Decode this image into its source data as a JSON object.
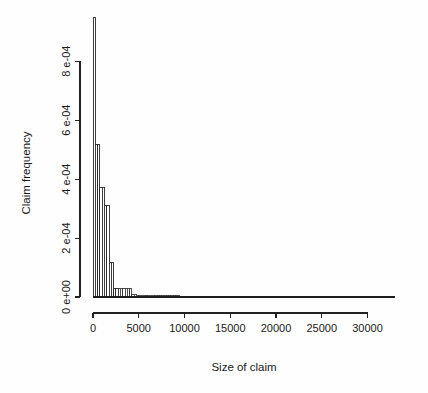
{
  "figure": {
    "background": "#fefefe",
    "foreground": "#1a1a1a"
  },
  "chart_data": {
    "type": "bar",
    "title": "",
    "subtitle": "",
    "xlabel": "Size of claim",
    "ylabel": "Claim frequency",
    "xlim": [
      0,
      33000
    ],
    "ylim": [
      0,
      0.00095
    ],
    "grid": false,
    "legend": null,
    "x_tick_values": [
      0,
      5000,
      10000,
      15000,
      20000,
      25000,
      30000
    ],
    "x_tick_labels": [
      "0",
      "5000",
      "10000",
      "15000",
      "20000",
      "25000",
      "30000"
    ],
    "y_tick_values": [
      0,
      0.0002,
      0.0004,
      0.0006,
      0.0008
    ],
    "y_tick_labels": [
      "0 e+00",
      "2 e-04",
      "4 e-04",
      "6 e-04",
      "8 e-04"
    ],
    "bin_width": 250,
    "bin_edges": [
      0,
      250,
      500,
      750,
      1000,
      1250,
      1500,
      1750,
      2000,
      2250,
      2500,
      2750,
      3000,
      3250,
      3500,
      3750,
      4000,
      4250,
      4500,
      4750,
      5000,
      5250,
      5500,
      5750,
      6000,
      6250,
      6500,
      6750,
      7000,
      7250,
      7500,
      7750,
      8000,
      8250,
      8500,
      8750,
      9000,
      9250,
      9500,
      9750,
      10000,
      10250,
      10500,
      10750,
      11000,
      11250,
      11500,
      11750,
      12000,
      12250,
      12500,
      12750,
      13000,
      13250,
      13500,
      13750,
      14000,
      14250,
      14500,
      14750,
      15000,
      15250,
      15500,
      15750,
      16000,
      16250,
      16500,
      16750,
      17000,
      17250,
      17500,
      17750,
      18000,
      18250,
      18500,
      18750,
      19000,
      19250,
      19500,
      19750,
      20000,
      20250,
      20500,
      20750,
      21000,
      21250,
      21500,
      21750,
      22000,
      22250,
      22500,
      22750,
      23000,
      23250,
      23500,
      23750,
      24000,
      24250,
      24500,
      24750,
      25000,
      25250,
      25500,
      25750,
      26000,
      26250,
      26500,
      26750,
      27000,
      27250,
      27500,
      27750,
      28000,
      28250,
      28500,
      28750,
      29000,
      29250,
      29500,
      29750,
      30000,
      30250,
      30500,
      30750,
      31000,
      31250,
      31500,
      31750,
      32000,
      32250,
      32500
    ],
    "values": [
      0.000948,
      0.000517,
      0.000516,
      0.000372,
      0.000371,
      0.000312,
      0.000311,
      0.000118,
      0.000117,
      2.95e-05,
      2.94e-05,
      2.92e-05,
      2.9e-05,
      2.88e-05,
      2.86e-05,
      2.84e-05,
      2.82e-05,
      8.8e-06,
      8.6e-06,
      6.6e-06,
      6.4e-06,
      6.2e-06,
      6e-06,
      5.8e-06,
      5.6e-06,
      5.4e-06,
      5.2e-06,
      5e-06,
      4.8e-06,
      4.6e-06,
      4.4e-06,
      4.2e-06,
      4e-06,
      3.9e-06,
      3.8e-06,
      3.7e-06,
      3.6e-06,
      3.5e-06,
      3.4e-06,
      3.3e-06,
      3.2e-06,
      3.1e-06,
      3e-06,
      2.9e-06,
      2.8e-06,
      2.7e-06,
      2.6e-06,
      2.6e-06,
      2.5e-06,
      2.5e-06,
      2.4e-06,
      2.4e-06,
      2.3e-06,
      2.3e-06,
      2.2e-06,
      2.2e-06,
      2.1e-06,
      2.1e-06,
      2e-06,
      2e-06,
      1.9e-06,
      1.9e-06,
      1.8e-06,
      1.8e-06,
      1.7e-06,
      1.7e-06,
      1.6e-06,
      1.6e-06,
      1.5e-06,
      1.5e-06,
      1.4e-06,
      1.4e-06,
      1.4e-06,
      1.3e-06,
      1.3e-06,
      1.3e-06,
      1.2e-06,
      1.2e-06,
      1.2e-06,
      1.1e-06,
      1.1e-06,
      1.1e-06,
      1e-06,
      1e-06,
      1e-06,
      1e-06,
      9e-07,
      9e-07,
      9e-07,
      9e-07,
      8e-07,
      8e-07,
      8e-07,
      8e-07,
      7e-07,
      7e-07,
      7e-07,
      7e-07,
      6e-07,
      6e-07,
      6e-07,
      6e-07,
      6e-07,
      5e-07,
      5e-07,
      5e-07,
      5e-07,
      5e-07,
      4e-07,
      4e-07,
      4e-07,
      4e-07,
      4e-07,
      4e-07,
      3e-07,
      3e-07,
      3e-07,
      3e-07,
      3e-07,
      3e-07,
      3e-07,
      2e-07,
      2e-07,
      2e-07,
      2e-07,
      2e-07,
      2e-07,
      2e-07
    ]
  }
}
